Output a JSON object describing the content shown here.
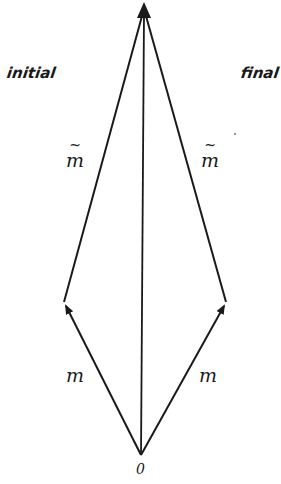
{
  "figure": {
    "background": "#ffffff",
    "ink_color": "#1a1a1a",
    "labels": {
      "initial": "initial",
      "final": "final",
      "m_tilde_left": "m",
      "m_tilde_right": "m",
      "tilde_mark": "~",
      "m_left": "m",
      "m_right": "m",
      "origin": "0"
    },
    "vectors": [
      {
        "name": "m-initial",
        "from": "0",
        "to": "left-vertex",
        "label": "m"
      },
      {
        "name": "m-tilde-initial",
        "from": "left-vertex",
        "to": "apex",
        "label": "m̃"
      },
      {
        "name": "m-final",
        "from": "0",
        "to": "right-vertex",
        "label": "m"
      },
      {
        "name": "m-tilde-final",
        "from": "right-vertex",
        "to": "apex",
        "label": "m̃"
      },
      {
        "name": "total",
        "from": "0",
        "to": "apex",
        "label": ""
      }
    ],
    "sides": [
      "initial",
      "final"
    ]
  }
}
